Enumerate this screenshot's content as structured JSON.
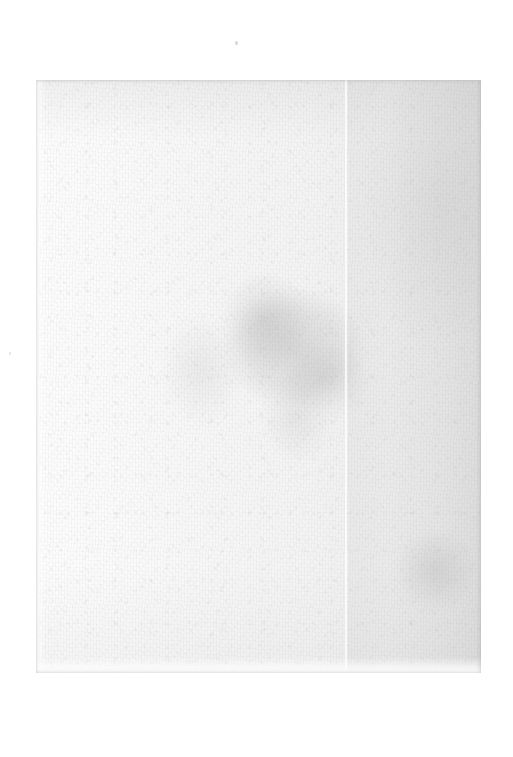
{
  "document": {
    "kind": "scanned-page",
    "title": "Scanned blank page",
    "description": "A scan of a blank, unprinted sheet of paper. No text, figures, headings, page numbers or marginalia are rendered anywhere in the image.",
    "text_content": "",
    "visible_text_items": []
  },
  "canvas": {
    "width_px": 513,
    "height_px": 757,
    "background_color": "#ffffff"
  },
  "page": {
    "left_px": 36,
    "top_px": 80,
    "width_px": 445,
    "height_px": 593,
    "paper_color_light": "#fdfdfd",
    "paper_color_mid": "#f4f4f4",
    "paper_color_dark": "#e7e7e7",
    "has_visible_border": false,
    "tone_direction": "brightest at left edge, progressively greyer toward right edge"
  },
  "artifacts": {
    "fold_crease": {
      "name": "vertical fold crease",
      "orientation": "vertical",
      "x_px": 345,
      "top_px": 80,
      "bottom_px": 673,
      "color": "#ffffff",
      "note": "pale vertical line running the full height of the sheet; a greyer band continues to the right of it"
    },
    "center_stain": {
      "name": "grey blotch",
      "shape": "irregular soft-edged ellipse",
      "center_x_px": 292,
      "center_y_px": 360,
      "width_px": 205,
      "height_px": 200,
      "color": "#969696",
      "opacity": 0.3
    },
    "left_halo": {
      "name": "faint secondary halo",
      "center_x_px": 201,
      "center_y_px": 370,
      "width_px": 110,
      "height_px": 150,
      "color": "#9b9b9b",
      "opacity": 0.14
    },
    "lower_right_patch": {
      "name": "lower right shading patch",
      "center_x_px": 433,
      "center_y_px": 570,
      "width_px": 105,
      "height_px": 110,
      "color": "#8c8c8c",
      "opacity": 0.22
    },
    "upper_right_shade": {
      "name": "upper right broad shading",
      "center_x_px": 440,
      "center_y_px": 206,
      "width_px": 145,
      "height_px": 300,
      "color": "#969696",
      "opacity": 0.14
    },
    "specks": [
      {
        "name": "speck-top",
        "x_px": 235,
        "y_px": 41,
        "width_px": 3,
        "height_px": 4,
        "color": "#cdcdcd"
      },
      {
        "name": "speck-mid-left",
        "x_px": 9,
        "y_px": 352,
        "width_px": 2,
        "height_px": 3,
        "color": "#dadada"
      }
    ],
    "texture": {
      "name": "paper fibre grain",
      "type": "fine fibrous mottled grain",
      "color": "#969696",
      "opacity": 0.55
    }
  }
}
